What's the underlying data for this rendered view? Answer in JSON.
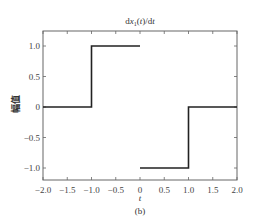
{
  "chart_data": {
    "type": "line",
    "xlabel": "t",
    "ylabel": "幅值",
    "caption": "(b)",
    "xlim": [
      -2.0,
      2.0
    ],
    "ylim": [
      -1.2,
      1.25
    ],
    "grid": false,
    "legend": null,
    "xticks": [
      -2.0,
      -1.5,
      -1.0,
      -0.5,
      0,
      0.5,
      1.0,
      1.5,
      2.0
    ],
    "xtick_labels": [
      "−2.0",
      "−1.5",
      "−1.0",
      "−0.5",
      "0",
      "0.5",
      "1.0",
      "1.5",
      "2.0"
    ],
    "yticks": [
      1.0,
      0.5,
      0,
      -0.5,
      -1.0
    ],
    "ytick_labels": [
      "1.0",
      "0.5",
      "0",
      "−0.5",
      "−1.0"
    ],
    "series": [
      {
        "name": "dx1(t)/dt",
        "color": "#222222",
        "x": [
          -2.0,
          -1.0,
          -1.0,
          0,
          0,
          1.0,
          1.0,
          2.0
        ],
        "y": [
          0,
          0,
          1.0,
          1.0,
          -1.0,
          -1.0,
          0,
          0
        ],
        "segments": [
          {
            "x": [
              -2.0,
              -1.0,
              -1.0,
              0
            ],
            "y": [
              0,
              0,
              1.0,
              1.0
            ]
          },
          {
            "x": [
              0,
              1.0,
              1.0,
              2.0
            ],
            "y": [
              -1.0,
              -1.0,
              0,
              0
            ]
          }
        ]
      }
    ]
  }
}
